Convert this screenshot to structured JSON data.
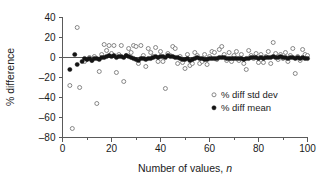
{
  "chart_data": {
    "type": "scatter",
    "title": "",
    "xlabel": "Number of values, n",
    "xlabel_plain": "Number of values,",
    "xlabel_italic": "n",
    "ylabel": "% difference",
    "xlim": [
      0,
      100
    ],
    "ylim": [
      -80,
      40
    ],
    "xticks": [
      0,
      20,
      40,
      60,
      80,
      100
    ],
    "yticks": [
      40,
      20,
      0,
      -20,
      -40,
      -60,
      -80
    ],
    "xtick_labels": [
      "0",
      "20",
      "40",
      "60",
      "80",
      "100"
    ],
    "ytick_labels": [
      "40",
      "20",
      "0",
      "-20",
      "-40",
      "-60",
      "-80"
    ],
    "xminor_ticks": [
      10,
      30,
      50,
      70,
      90
    ],
    "grid": false,
    "zero_reference_line": true,
    "legend_position": "center-right",
    "series": [
      {
        "name": "% diff std dev",
        "marker": "open-circle",
        "color": "#7a7a7a",
        "points": [
          [
            3,
            -28
          ],
          [
            4,
            -71
          ],
          [
            6,
            30
          ],
          [
            7,
            -30
          ],
          [
            9,
            -4
          ],
          [
            10,
            -2
          ],
          [
            11,
            0
          ],
          [
            12,
            -3
          ],
          [
            13,
            1
          ],
          [
            14,
            -46
          ],
          [
            15,
            -14
          ],
          [
            16,
            3
          ],
          [
            17,
            13
          ],
          [
            18,
            7
          ],
          [
            19,
            12
          ],
          [
            20,
            4
          ],
          [
            21,
            12
          ],
          [
            22,
            -15
          ],
          [
            23,
            3
          ],
          [
            24,
            12
          ],
          [
            25,
            -24
          ],
          [
            26,
            2
          ],
          [
            27,
            9
          ],
          [
            28,
            5
          ],
          [
            29,
            12
          ],
          [
            30,
            11
          ],
          [
            31,
            -6
          ],
          [
            32,
            12
          ],
          [
            33,
            2
          ],
          [
            34,
            -9
          ],
          [
            35,
            9
          ],
          [
            36,
            5
          ],
          [
            37,
            1
          ],
          [
            38,
            10
          ],
          [
            39,
            -4
          ],
          [
            40,
            6
          ],
          [
            41,
            -4
          ],
          [
            42,
            -31
          ],
          [
            43,
            4
          ],
          [
            44,
            2
          ],
          [
            45,
            11
          ],
          [
            46,
            9
          ],
          [
            47,
            -6
          ],
          [
            48,
            1
          ],
          [
            49,
            -5
          ],
          [
            50,
            -11
          ],
          [
            51,
            3
          ],
          [
            52,
            -8
          ],
          [
            53,
            -6
          ],
          [
            54,
            5
          ],
          [
            55,
            2
          ],
          [
            56,
            -6
          ],
          [
            57,
            -4
          ],
          [
            58,
            3
          ],
          [
            59,
            -7
          ],
          [
            60,
            1
          ],
          [
            61,
            6
          ],
          [
            62,
            5
          ],
          [
            63,
            -2
          ],
          [
            64,
            8
          ],
          [
            65,
            11
          ],
          [
            66,
            3
          ],
          [
            67,
            -3
          ],
          [
            68,
            5
          ],
          [
            69,
            -4
          ],
          [
            70,
            2
          ],
          [
            71,
            6
          ],
          [
            72,
            -3
          ],
          [
            73,
            3
          ],
          [
            74,
            -6
          ],
          [
            75,
            -12
          ],
          [
            76,
            7
          ],
          [
            77,
            2
          ],
          [
            78,
            -1
          ],
          [
            79,
            4
          ],
          [
            80,
            -5
          ],
          [
            81,
            3
          ],
          [
            82,
            -5
          ],
          [
            83,
            1
          ],
          [
            84,
            6
          ],
          [
            85,
            -6
          ],
          [
            86,
            15
          ],
          [
            87,
            4
          ],
          [
            88,
            -2
          ],
          [
            89,
            3
          ],
          [
            90,
            -1
          ],
          [
            91,
            5
          ],
          [
            92,
            -4
          ],
          [
            93,
            2
          ],
          [
            94,
            9
          ],
          [
            95,
            -16
          ],
          [
            96,
            1
          ],
          [
            97,
            -3
          ],
          [
            98,
            8
          ],
          [
            99,
            3
          ],
          [
            100,
            2
          ]
        ]
      },
      {
        "name": "% diff mean",
        "marker": "filled-circle",
        "color": "#141414",
        "points": [
          [
            3,
            -12
          ],
          [
            5,
            3
          ],
          [
            6,
            -7
          ],
          [
            8,
            -4
          ],
          [
            9,
            -1
          ],
          [
            10,
            -2
          ],
          [
            11,
            -1
          ],
          [
            12,
            -3
          ],
          [
            13,
            -1
          ],
          [
            14,
            -1
          ],
          [
            15,
            -2
          ],
          [
            16,
            0
          ],
          [
            17,
            0
          ],
          [
            18,
            1
          ],
          [
            19,
            2
          ],
          [
            20,
            1
          ],
          [
            21,
            2
          ],
          [
            22,
            0
          ],
          [
            23,
            1
          ],
          [
            24,
            1
          ],
          [
            25,
            0
          ],
          [
            26,
            2
          ],
          [
            27,
            1
          ],
          [
            28,
            0
          ],
          [
            29,
            -1
          ],
          [
            30,
            -2
          ],
          [
            31,
            -3
          ],
          [
            32,
            -1
          ],
          [
            33,
            -1
          ],
          [
            34,
            -2
          ],
          [
            35,
            -1
          ],
          [
            36,
            -1
          ],
          [
            37,
            0
          ],
          [
            38,
            1
          ],
          [
            39,
            0
          ],
          [
            40,
            1
          ],
          [
            41,
            1
          ],
          [
            42,
            0
          ],
          [
            43,
            2
          ],
          [
            44,
            1
          ],
          [
            45,
            1
          ],
          [
            46,
            0
          ],
          [
            47,
            0
          ],
          [
            48,
            -1
          ],
          [
            49,
            -2
          ],
          [
            50,
            -2
          ],
          [
            51,
            -1
          ],
          [
            52,
            -3
          ],
          [
            53,
            -2
          ],
          [
            54,
            -1
          ],
          [
            55,
            0
          ],
          [
            56,
            -1
          ],
          [
            57,
            -1
          ],
          [
            58,
            -2
          ],
          [
            59,
            -2
          ],
          [
            60,
            -1
          ],
          [
            61,
            -1
          ],
          [
            62,
            -1
          ],
          [
            63,
            -1
          ],
          [
            64,
            0
          ],
          [
            65,
            0
          ],
          [
            66,
            0
          ],
          [
            67,
            -1
          ],
          [
            68,
            -1
          ],
          [
            69,
            -1
          ],
          [
            70,
            -1
          ],
          [
            71,
            -1
          ],
          [
            72,
            -1
          ],
          [
            73,
            -1
          ],
          [
            74,
            -2
          ],
          [
            75,
            -1
          ],
          [
            76,
            -1
          ],
          [
            77,
            0
          ],
          [
            78,
            0
          ],
          [
            79,
            0
          ],
          [
            80,
            -1
          ],
          [
            81,
            0
          ],
          [
            82,
            -1
          ],
          [
            83,
            0
          ],
          [
            84,
            0
          ],
          [
            85,
            0
          ],
          [
            86,
            1
          ],
          [
            87,
            0
          ],
          [
            88,
            0
          ],
          [
            89,
            1
          ],
          [
            90,
            0
          ],
          [
            91,
            0
          ],
          [
            92,
            -1
          ],
          [
            93,
            0
          ],
          [
            94,
            0
          ],
          [
            95,
            -1
          ],
          [
            96,
            0
          ],
          [
            97,
            -1
          ],
          [
            98,
            0
          ],
          [
            99,
            -1
          ],
          [
            100,
            -1
          ]
        ]
      }
    ],
    "legend": [
      {
        "label": "% diff std dev",
        "marker": "open-circle"
      },
      {
        "label": "% diff mean",
        "marker": "filled-circle"
      }
    ]
  }
}
